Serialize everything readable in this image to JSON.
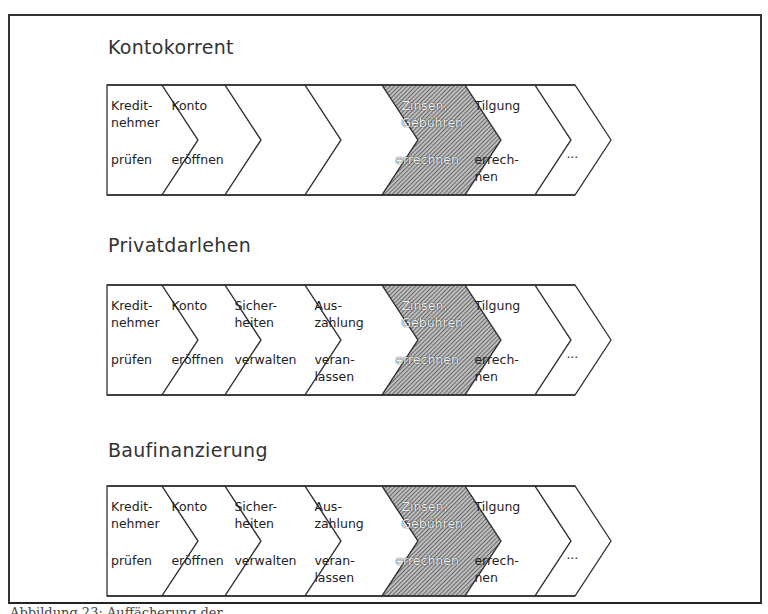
{
  "diagram": {
    "type": "value-chain-comparison",
    "rows": [
      {
        "title": "Kontokorrent",
        "steps": [
          {
            "top": "Kredit-\nnehmer",
            "bottom": "prüfen",
            "shaded": false
          },
          {
            "top": "Konto",
            "bottom": "eröffnen",
            "shaded": false
          },
          {
            "top": "",
            "bottom": "",
            "shaded": false
          },
          {
            "top": "",
            "bottom": "",
            "shaded": false
          },
          {
            "top": "Zinsen,\nGebühren",
            "bottom": "errechnen",
            "shaded": true
          },
          {
            "top": "Tilgung",
            "bottom": "errech-\nnen",
            "shaded": false
          },
          {
            "top": "",
            "bottom": "...",
            "shaded": false
          }
        ]
      },
      {
        "title": "Privatdarlehen",
        "steps": [
          {
            "top": "Kredit-\nnehmer",
            "bottom": "prüfen",
            "shaded": false
          },
          {
            "top": "Konto",
            "bottom": "eröffnen",
            "shaded": false
          },
          {
            "top": "Sicher-\nheiten",
            "bottom": "verwalten",
            "shaded": false
          },
          {
            "top": "Aus-\nzahlung",
            "bottom": "veran-\nlassen",
            "shaded": false
          },
          {
            "top": "Zinsen,\nGebühren",
            "bottom": "errechnen",
            "shaded": true
          },
          {
            "top": "Tilgung",
            "bottom": "errech-\nnen",
            "shaded": false
          },
          {
            "top": "",
            "bottom": "...",
            "shaded": false
          }
        ]
      },
      {
        "title": "Baufinanzierung",
        "steps": [
          {
            "top": "Kredit-\nnehmer",
            "bottom": "prüfen",
            "shaded": false
          },
          {
            "top": "Konto",
            "bottom": "eröffnen",
            "shaded": false
          },
          {
            "top": "Sicher-\nheiten",
            "bottom": "verwalten",
            "shaded": false
          },
          {
            "top": "Aus-\nzahlung",
            "bottom": "veran-\nlassen",
            "shaded": false
          },
          {
            "top": "Zinsen,\nGebühren",
            "bottom": "errechnen",
            "shaded": true
          },
          {
            "top": "Tilgung",
            "bottom": "errech-\nnen",
            "shaded": false
          },
          {
            "top": "",
            "bottom": "...",
            "shaded": false
          }
        ]
      }
    ],
    "colors": {
      "line": "#333333",
      "hatch": "#555555",
      "background": "#ffffff"
    }
  },
  "caption": {
    "text": "Abbildung 23: Auffächerung der ..."
  }
}
